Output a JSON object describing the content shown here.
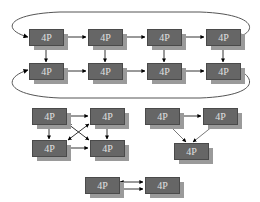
{
  "diagram": {
    "node_label": "4P",
    "colors": {
      "box": "#666666",
      "shadow": "#9a9a9a",
      "label": "#e0e0e0",
      "edge": "#000000",
      "ring": "#555555"
    },
    "groups": [
      {
        "name": "torus-2x4",
        "nodes": [
          {
            "id": "a1",
            "label": "4P",
            "x": 29,
            "y": 29
          },
          {
            "id": "a2",
            "label": "4P",
            "x": 88,
            "y": 29
          },
          {
            "id": "a3",
            "label": "4P",
            "x": 147,
            "y": 29
          },
          {
            "id": "a4",
            "label": "4P",
            "x": 206,
            "y": 29
          },
          {
            "id": "b1",
            "label": "4P",
            "x": 29,
            "y": 63
          },
          {
            "id": "b2",
            "label": "4P",
            "x": 88,
            "y": 63
          },
          {
            "id": "b3",
            "label": "4P",
            "x": 147,
            "y": 63
          },
          {
            "id": "b4",
            "label": "4P",
            "x": 206,
            "y": 63
          }
        ]
      },
      {
        "name": "full-mesh-4",
        "nodes": [
          {
            "id": "m1",
            "label": "4P",
            "x": 32,
            "y": 108
          },
          {
            "id": "m2",
            "label": "4P",
            "x": 90,
            "y": 108
          },
          {
            "id": "m3",
            "label": "4P",
            "x": 32,
            "y": 140
          },
          {
            "id": "m4",
            "label": "4P",
            "x": 90,
            "y": 140
          }
        ]
      },
      {
        "name": "triangle-3",
        "nodes": [
          {
            "id": "t1",
            "label": "4P",
            "x": 145,
            "y": 108
          },
          {
            "id": "t2",
            "label": "4P",
            "x": 203,
            "y": 108
          },
          {
            "id": "t3",
            "label": "4P",
            "x": 174,
            "y": 143
          }
        ]
      },
      {
        "name": "pair-2",
        "nodes": [
          {
            "id": "p1",
            "label": "4P",
            "x": 85,
            "y": 177
          },
          {
            "id": "p2",
            "label": "4P",
            "x": 145,
            "y": 177
          }
        ]
      }
    ]
  }
}
